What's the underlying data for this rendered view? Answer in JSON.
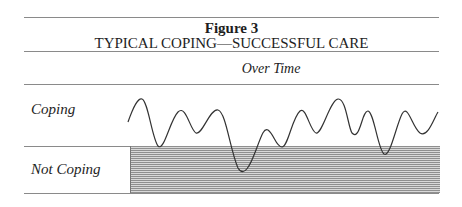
{
  "figure": {
    "number_label": "Figure 3",
    "title": "TYPICAL COPING—SUCCESSFUL CARE",
    "column_header": "Over Time",
    "rows": [
      {
        "label": "Coping"
      },
      {
        "label": "Not Coping"
      }
    ]
  },
  "diagram": {
    "type": "oscillating-line",
    "dips_into_not_coping": 3,
    "colors": {
      "line": "#333333",
      "shade": "#b5b5b5",
      "rule": "#8a8a8a"
    }
  }
}
